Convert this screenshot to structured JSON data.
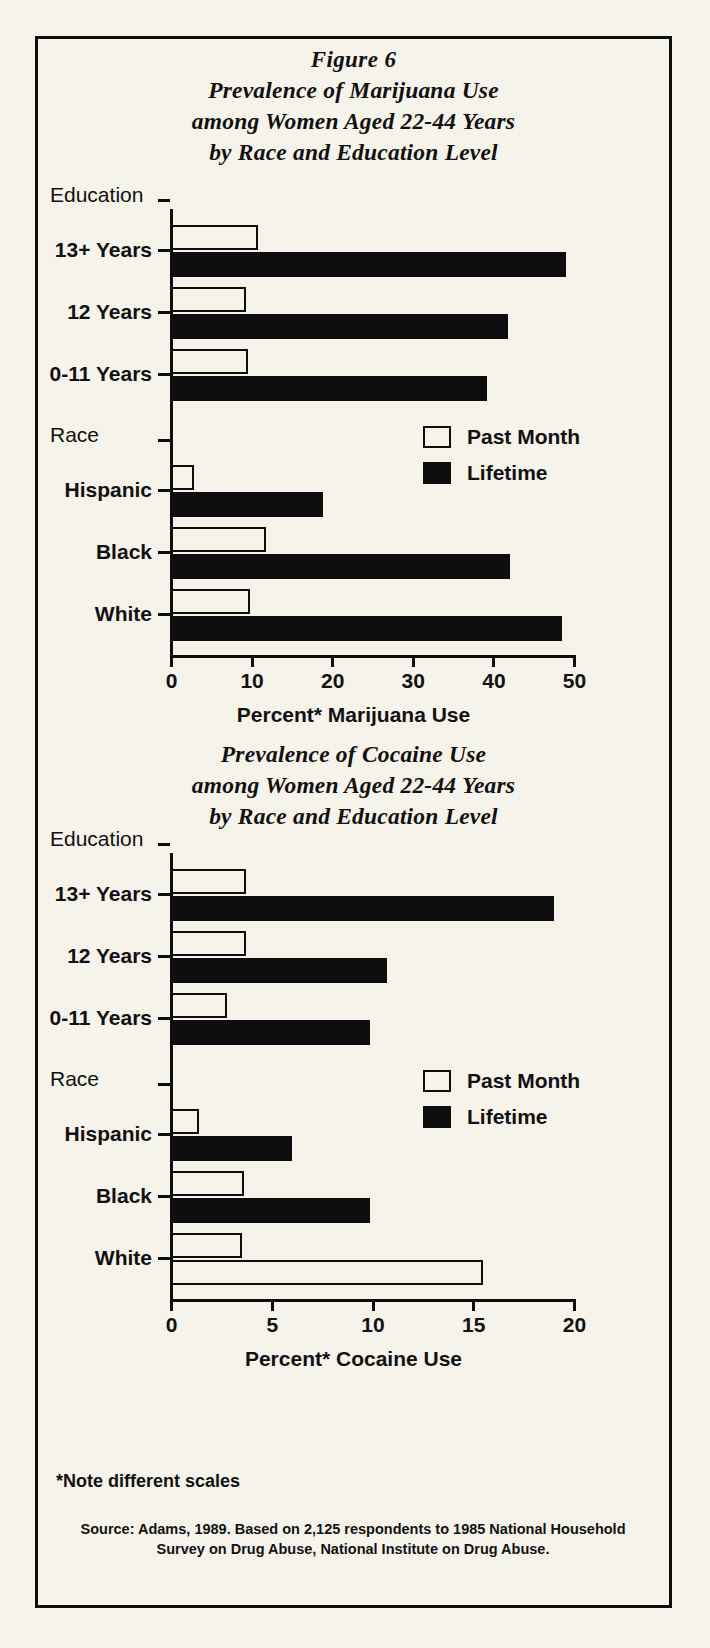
{
  "figure": {
    "number": "Figure 6",
    "title_lines": [
      "Prevalence of Marijuana Use",
      "among Women Aged 22-44 Years",
      "by Race and Education Level"
    ]
  },
  "chart2_title_lines": [
    "Prevalence of Cocaine Use",
    "among Women Aged 22-44 Years",
    "by Race and Education Level"
  ],
  "legend": {
    "past_month": "Past Month",
    "lifetime": "Lifetime"
  },
  "groups": {
    "education": "Education",
    "race": "Race"
  },
  "footnotes": {
    "note": "*Note different scales",
    "source_line1": "Source: Adams, 1989. Based on 2,125 respondents to 1985 National Household",
    "source_line2": "Survey on Drug Abuse, National Institute on Drug Abuse."
  },
  "colors": {
    "background": "#f6f3ea",
    "ink": "#0d0d0d"
  },
  "chart_data": [
    {
      "type": "bar",
      "orientation": "horizontal",
      "title": "Prevalence of Marijuana Use among Women Aged 22-44 Years by Race and Education Level",
      "xlabel": "Percent* Marijuana Use",
      "ylabel": "",
      "xlim": [
        0,
        50
      ],
      "xticks": [
        0,
        10,
        20,
        30,
        40,
        50
      ],
      "grid": false,
      "legend_position": "upper right",
      "categories": [
        "13+ Years",
        "12 Years",
        "0-11 Years",
        "Hispanic",
        "Black",
        "White"
      ],
      "group_of": [
        "Education",
        "Education",
        "Education",
        "Race",
        "Race",
        "Race"
      ],
      "series": [
        {
          "name": "Past Month",
          "values": [
            10.8,
            9.3,
            9.5,
            2.8,
            11.8,
            9.8
          ]
        },
        {
          "name": "Lifetime",
          "values": [
            49.0,
            41.8,
            39.2,
            18.8,
            42.0,
            48.5
          ]
        }
      ]
    },
    {
      "type": "bar",
      "orientation": "horizontal",
      "title": "Prevalence of Cocaine Use among Women Aged 22-44 Years by Race and Education Level",
      "xlabel": "Percent* Cocaine Use",
      "ylabel": "",
      "xlim": [
        0,
        20
      ],
      "xticks": [
        0,
        5,
        10,
        15,
        20
      ],
      "grid": false,
      "legend_position": "upper right",
      "categories": [
        "13+ Years",
        "12 Years",
        "0-11 Years",
        "Hispanic",
        "Black",
        "White"
      ],
      "group_of": [
        "Education",
        "Education",
        "Education",
        "Race",
        "Race",
        "Race"
      ],
      "series": [
        {
          "name": "Past Month",
          "values": [
            3.7,
            3.7,
            2.8,
            1.4,
            3.6,
            3.5
          ]
        },
        {
          "name": "Lifetime",
          "values": [
            19.0,
            10.7,
            9.9,
            6.0,
            9.9,
            15.5
          ]
        }
      ]
    }
  ]
}
